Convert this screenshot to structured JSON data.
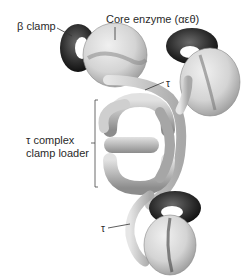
{
  "figure": {
    "labels": {
      "beta_clamp": "β clamp",
      "core_enzyme": "Core enzyme (αεθ)",
      "tau_top": "τ",
      "tau_complex_line1": "τ complex",
      "tau_complex_line2": "clamp loader",
      "tau_bottom": "τ"
    },
    "colors": {
      "clamp_dark": "#2b2b2b",
      "core_light": "#d9d9d9",
      "loader_mid": "#b5b5b5",
      "line": "#333333"
    }
  }
}
